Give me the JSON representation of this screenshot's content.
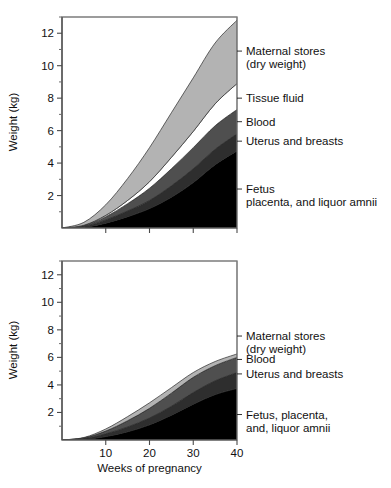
{
  "figure": {
    "title": "",
    "width": 391,
    "height": 488
  },
  "chart_data": [
    {
      "id": "top",
      "type": "area",
      "stacked": true,
      "title": "",
      "xlabel": "",
      "ylabel": "Weight (kg)",
      "xlim": [
        0,
        40
      ],
      "ylim": [
        0,
        13
      ],
      "xticks": [
        10,
        20,
        30,
        40
      ],
      "xticklabels": [
        "",
        "",
        "",
        ""
      ],
      "yticks": [
        2,
        4,
        6,
        8,
        10,
        12
      ],
      "yticklabels": [
        "2",
        "4",
        "6",
        "8",
        "10",
        "12"
      ],
      "yminorticks": [
        1,
        3,
        5,
        7,
        9,
        11,
        13
      ],
      "grid": false,
      "legend_position": "right-outside",
      "x": [
        0,
        5,
        10,
        15,
        20,
        25,
        30,
        35,
        40
      ],
      "series": [
        {
          "name": "Fetus placenta, and liquor amnii",
          "color": "#000000",
          "values": [
            0,
            0.05,
            0.3,
            0.7,
            1.2,
            1.9,
            2.8,
            3.9,
            4.75
          ]
        },
        {
          "name": "Uterus and breasts",
          "color": "#2e2e2e",
          "values": [
            0,
            0.05,
            0.2,
            0.35,
            0.5,
            0.7,
            0.85,
            0.95,
            1.05
          ]
        },
        {
          "name": "Blood",
          "color": "#4f4f4f",
          "values": [
            0,
            0.05,
            0.2,
            0.45,
            0.75,
            1.05,
            1.3,
            1.45,
            1.5
          ]
        },
        {
          "name": "Tissue fluid",
          "color": "#ffffff",
          "values": [
            0,
            0.02,
            0.08,
            0.2,
            0.4,
            0.7,
            1.0,
            1.35,
            1.6
          ]
        },
        {
          "name": "Maternal stores (dry weight)",
          "color": "#b3b3b3",
          "values": [
            0,
            0.18,
            0.65,
            1.35,
            2.1,
            2.75,
            3.3,
            3.75,
            3.9
          ]
        }
      ],
      "legend": [
        {
          "key": "maternal-stores",
          "lines": [
            "Maternal stores",
            "(dry weight)"
          ],
          "y_value": 10.9
        },
        {
          "key": "tissue-fluid",
          "lines": [
            "Tissue fluid"
          ],
          "y_value": 8.0
        },
        {
          "key": "blood",
          "lines": [
            "Blood"
          ],
          "y_value": 6.55
        },
        {
          "key": "uterus-and-breasts",
          "lines": [
            "Uterus and breasts"
          ],
          "y_value": 5.35
        },
        {
          "key": "fetus-placenta",
          "lines": [
            "Fetus",
            "placenta, and liquor amnii"
          ],
          "y_value": 2.4
        }
      ]
    },
    {
      "id": "bottom",
      "type": "area",
      "stacked": true,
      "title": "",
      "xlabel": "Weeks of pregnancy",
      "ylabel": "Weight (kg)",
      "xlim": [
        0,
        40
      ],
      "ylim": [
        0,
        13
      ],
      "xticks": [
        10,
        20,
        30,
        40
      ],
      "xticklabels": [
        "10",
        "20",
        "30",
        "40"
      ],
      "yticks": [
        2,
        4,
        6,
        8,
        10,
        12
      ],
      "yticklabels": [
        "2",
        "4",
        "6",
        "8",
        "10",
        "12"
      ],
      "yminorticks": [
        1,
        3,
        5,
        7,
        9,
        11,
        13
      ],
      "grid": false,
      "legend_position": "right-outside",
      "x": [
        0,
        5,
        10,
        15,
        20,
        25,
        30,
        35,
        40
      ],
      "series": [
        {
          "name": "Fetus, placenta, and, liquor amnii",
          "color": "#000000",
          "values": [
            0,
            0.05,
            0.25,
            0.6,
            1.1,
            1.8,
            2.6,
            3.3,
            3.75
          ]
        },
        {
          "name": "Uterus and breasts",
          "color": "#2e2e2e",
          "values": [
            0,
            0.05,
            0.2,
            0.35,
            0.5,
            0.65,
            0.85,
            1.0,
            1.15
          ]
        },
        {
          "name": "Blood",
          "color": "#4f4f4f",
          "values": [
            0,
            0.05,
            0.2,
            0.45,
            0.7,
            0.95,
            1.1,
            1.1,
            1.1
          ]
        },
        {
          "name": "Maternal stores (dry weight)",
          "color": "#b3b3b3",
          "values": [
            0,
            0.03,
            0.15,
            0.3,
            0.4,
            0.4,
            0.35,
            0.3,
            0.25
          ]
        }
      ],
      "legend": [
        {
          "key": "maternal-stores",
          "lines": [
            "Maternal stores",
            "(dry weight)"
          ],
          "y_value": 7.55
        },
        {
          "key": "blood",
          "lines": [
            "Blood"
          ],
          "y_value": 5.85
        },
        {
          "key": "uterus-and-breasts",
          "lines": [
            "Uterus and breasts"
          ],
          "y_value": 4.8
        },
        {
          "key": "fetus-placenta",
          "lines": [
            "Fetus, placenta,",
            "and, liquor amnii"
          ],
          "y_value": 1.85
        }
      ]
    }
  ]
}
